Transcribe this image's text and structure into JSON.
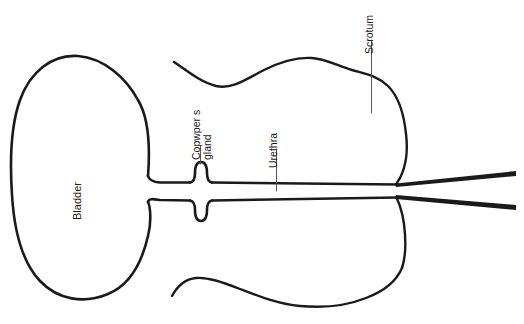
{
  "diagram": {
    "background_color": "#ffffff",
    "stroke_color": "#1a1a1a",
    "width": 524,
    "height": 324,
    "labels": {
      "bladder": "Bladder",
      "cowper_line1": "Copwper s",
      "cowper_line2": "gland",
      "urethra": "Urethra",
      "scrotum": "Scrotum"
    },
    "parts": [
      {
        "name": "bladder",
        "label": "Bladder",
        "shape": "large-oval",
        "bounds": [
          12,
          55,
          155,
          300
        ]
      },
      {
        "name": "cowper-gland-upper",
        "label": "Copwper s gland",
        "shape": "small-bulb",
        "center": [
          200,
          172
        ]
      },
      {
        "name": "cowper-gland-lower",
        "label": "Copwper s gland",
        "shape": "small-bulb",
        "center": [
          200,
          210
        ]
      },
      {
        "name": "urethra",
        "label": "Urethra",
        "shape": "horizontal-tube",
        "bounds": [
          205,
          182,
          400,
          200
        ]
      },
      {
        "name": "scrotum",
        "label": "Scrotum",
        "shape": "open-outline",
        "bounds": [
          172,
          58,
          408,
          300
        ]
      },
      {
        "name": "vas-deferens-upper",
        "shape": "tapered-line",
        "bounds": [
          396,
          172,
          516,
          188
        ]
      },
      {
        "name": "vas-deferens-lower",
        "shape": "tapered-line",
        "bounds": [
          396,
          196,
          516,
          210
        ]
      }
    ]
  }
}
